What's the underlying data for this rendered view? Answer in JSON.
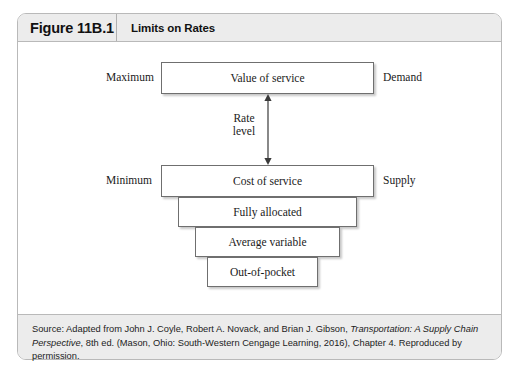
{
  "figure": {
    "number": "Figure 11B.1",
    "title": "Limits on Rates"
  },
  "diagram": {
    "boxes": [
      {
        "id": "value-of-service",
        "label": "Value of service"
      },
      {
        "id": "cost-of-service",
        "label": "Cost of service"
      },
      {
        "id": "fully-allocated",
        "label": "Fully allocated"
      },
      {
        "id": "average-variable",
        "label": "Average variable"
      },
      {
        "id": "out-of-pocket",
        "label": "Out-of-pocket"
      }
    ],
    "side_labels": {
      "maximum": "Maximum",
      "demand": "Demand",
      "minimum": "Minimum",
      "supply": "Supply"
    },
    "arrow": {
      "label_line1": "Rate",
      "label_line2": "level",
      "icon": "double-headed-vertical-arrow-icon"
    }
  },
  "source": {
    "prefix": "Source: Adapted from John J. Coyle, Robert A. Novack, and Brian J. Gibson, ",
    "title_italic": "Transportation: A Supply Chain Perspective",
    "suffix": ", 8th ed. (Mason, Ohio: South-Western Cengage Learning, 2016), Chapter 4. Reproduced by permission."
  },
  "colors": {
    "frame_border": "#b9b9b9",
    "band_background": "#ececec",
    "box_border": "#6f6f6f",
    "text": "#1a1a1a"
  }
}
